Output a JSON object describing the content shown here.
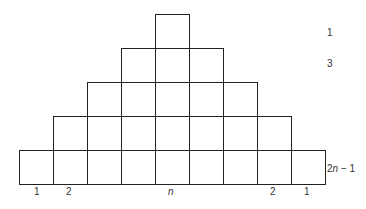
{
  "diagram": {
    "title": "",
    "cell_size": 34,
    "origin_x": 19,
    "origin_y": 14,
    "stroke_color": "#222222",
    "rows": [
      {
        "index": 0,
        "count": 1,
        "start_col": 4,
        "right_label": "1"
      },
      {
        "index": 1,
        "count": 3,
        "start_col": 3,
        "right_label": "3"
      },
      {
        "index": 2,
        "count": 5,
        "start_col": 2,
        "right_label": ""
      },
      {
        "index": 3,
        "count": 7,
        "start_col": 1,
        "right_label": ""
      },
      {
        "index": 4,
        "count": 9,
        "start_col": 0,
        "right_label": "2n − 1"
      }
    ],
    "bottom_labels": [
      {
        "text": "1",
        "col": 0
      },
      {
        "text": "2",
        "col": 1
      },
      {
        "text": "n",
        "col": 4,
        "italic": true
      },
      {
        "text": "2",
        "col": 7
      },
      {
        "text": "1",
        "col": 8
      }
    ],
    "right_labels": {
      "row1": "1",
      "row2": "3",
      "row_last_prefix": "2",
      "row_last_var": "n",
      "row_last_suffix": " − 1"
    }
  }
}
